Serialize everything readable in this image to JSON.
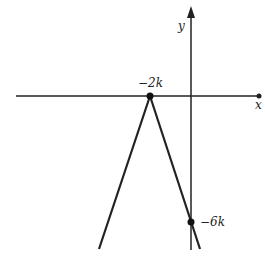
{
  "diagram": {
    "axes": {
      "x_label": "x",
      "y_label": "y"
    },
    "points": [
      {
        "name": "vertex",
        "label": "−2k"
      },
      {
        "name": "y-intercept",
        "label": "−6k"
      }
    ],
    "colors": {
      "stroke": "#222222",
      "background": "#ffffff"
    }
  }
}
